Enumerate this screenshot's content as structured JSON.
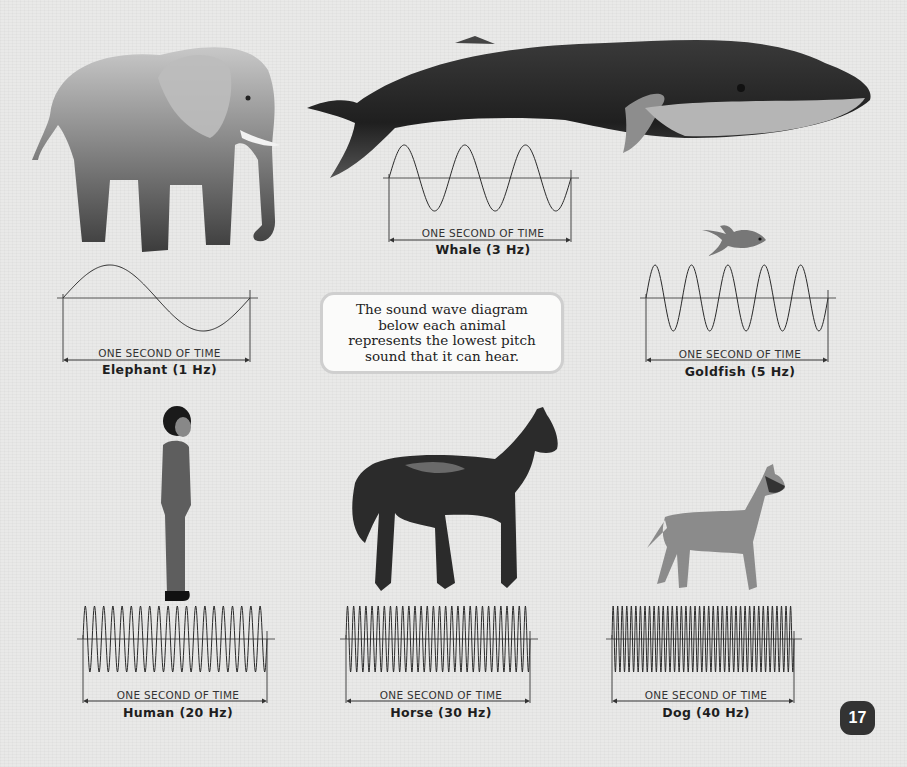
{
  "note": {
    "line1": "The sound wave diagram",
    "line2": "below each animal",
    "line3": "represents the lowest pitch",
    "line4": "sound that it can hear."
  },
  "page_number": "17",
  "axis_label": "ONE SECOND OF TIME",
  "animals": [
    {
      "name": "Elephant",
      "hz": 1,
      "label": "Elephant (1 Hz)",
      "axis_label": "ONE SECOND OF TIME"
    },
    {
      "name": "Whale",
      "hz": 3,
      "label": "Whale (3 Hz)",
      "axis_label": "ONE SECOND OF TIME"
    },
    {
      "name": "Goldfish",
      "hz": 5,
      "label": "Goldfish (5 Hz)",
      "axis_label": "ONE SECOND OF TIME"
    },
    {
      "name": "Human",
      "hz": 20,
      "label": "Human (20 Hz)",
      "axis_label": "ONE SECOND OF TIME"
    },
    {
      "name": "Horse",
      "hz": 30,
      "label": "Horse (30 Hz)",
      "axis_label": "ONE SECOND OF TIME"
    },
    {
      "name": "Dog",
      "hz": 40,
      "label": "Dog (40 Hz)",
      "axis_label": "ONE SECOND OF TIME"
    }
  ],
  "colors": {
    "background": "#e9e9e8",
    "wave": "#2a2a2a",
    "page_badge": "#333333"
  }
}
